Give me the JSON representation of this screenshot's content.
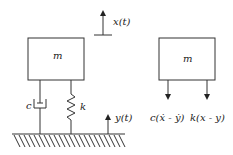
{
  "diagram": {
    "left_system": {
      "mass_label": "m",
      "damper_label": "c",
      "spring_label": "k",
      "displacement_label": "x(t)",
      "base_excitation_label": "y(t)"
    },
    "free_body_diagram": {
      "mass_label": "m",
      "damper_force_label": "c(ẋ - ẏ)",
      "spring_force_label": "k(x - y)"
    }
  }
}
